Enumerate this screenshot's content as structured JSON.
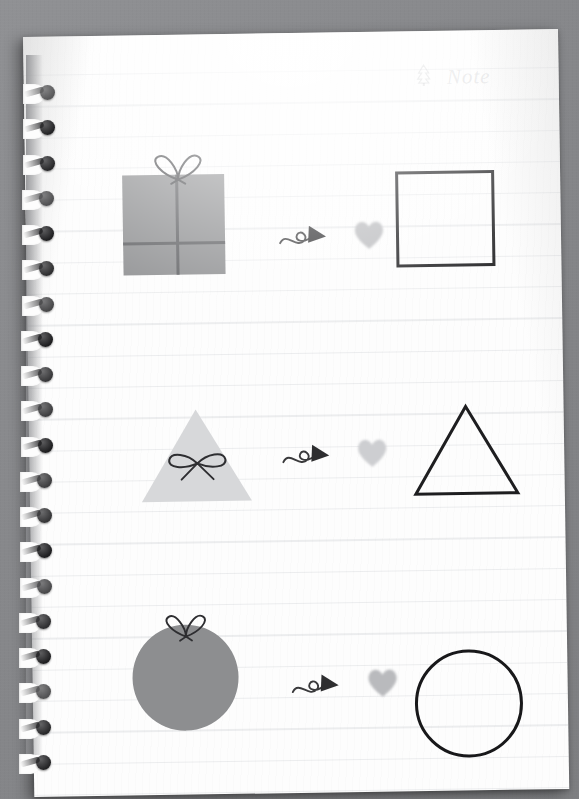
{
  "scene": {
    "type": "photo-of-notebook-page",
    "background_color": "#8b8c8e",
    "page_color": "#fdfdfd",
    "ruled_line_color": "#7b8490",
    "binding": {
      "name": "spiral-wire-binding",
      "ring_color": "#1d1d1f",
      "ring_count": 20
    }
  },
  "header": {
    "label": "Note",
    "label_color": "#96989c",
    "icon": "pine-tree-doodle"
  },
  "rows": [
    {
      "id": "row-square",
      "filled_shape": {
        "name": "gift-box-square",
        "shape": "square",
        "fill": "#8d8e90",
        "ribbon_color": "#5d5e61",
        "has_bow": true
      },
      "arrow": {
        "name": "curly-arrow-right",
        "color": "#3a3a3c"
      },
      "heart": {
        "name": "heart",
        "fill": "#b9babd"
      },
      "outline_shape": {
        "name": "square-outline",
        "shape": "square",
        "stroke": "#1e1e20",
        "stroke_width": 3
      }
    },
    {
      "id": "row-triangle",
      "filled_shape": {
        "name": "gift-triangle",
        "shape": "triangle",
        "fill": "#d7d8da",
        "ribbon_color": "#2e2e31",
        "has_bow": true
      },
      "arrow": {
        "name": "curly-arrow-right",
        "color": "#3a3a3c"
      },
      "heart": {
        "name": "heart",
        "fill": "#cdced1"
      },
      "outline_shape": {
        "name": "triangle-outline",
        "shape": "triangle",
        "stroke": "#1e1e20",
        "stroke_width": 3
      }
    },
    {
      "id": "row-circle",
      "filled_shape": {
        "name": "gift-circle",
        "shape": "circle",
        "fill": "#8d8e90",
        "ribbon_color": "#2e2e31",
        "has_bow": true
      },
      "arrow": {
        "name": "curly-arrow-right",
        "color": "#3a3a3c"
      },
      "heart": {
        "name": "heart",
        "fill": "#b9babd"
      },
      "outline_shape": {
        "name": "circle-outline",
        "shape": "circle",
        "stroke": "#18181a",
        "stroke_width": 3.5
      }
    }
  ]
}
